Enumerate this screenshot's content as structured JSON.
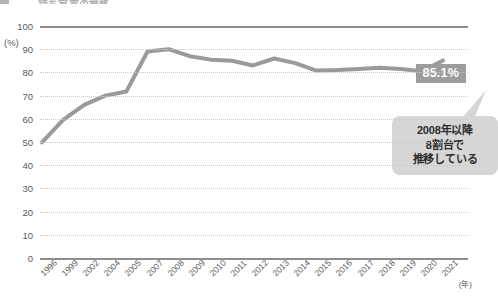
{
  "title": {
    "marker": "legend-square",
    "text": "持ち家率の推移"
  },
  "axes": {
    "y_unit": "(%)",
    "x_unit": "(年)",
    "y_ticks": [
      "100",
      "90",
      "80",
      "70",
      "60",
      "50",
      "40",
      "30",
      "20",
      "10",
      "0"
    ]
  },
  "annotations": {
    "value_badge": "85.1%",
    "callout": {
      "line1": "2008年以降",
      "line2": "8割台で",
      "line3": "推移している"
    }
  },
  "colors": {
    "series_line": "#9a9a9a",
    "axis": "#8e8e8e",
    "gridline": "#c9c9c9",
    "badge_bg": "#9d9d9d",
    "badge_text": "#ffffff",
    "callout_bg": "#d6d6d6",
    "callout_text": "#2d2d2d"
  },
  "chart_data": {
    "type": "line",
    "title": "持ち家率の推移",
    "xlabel": "(年)",
    "ylabel": "(%)",
    "ylim": [
      0,
      100
    ],
    "ytick_step": 10,
    "grid": true,
    "legend": false,
    "categories": [
      "1996",
      "1999",
      "2002",
      "2004",
      "2005",
      "2007",
      "2008",
      "2009",
      "2010",
      "2011",
      "2012",
      "2013",
      "2014",
      "2015",
      "2016",
      "2017",
      "2018",
      "2019",
      "2020",
      "2021"
    ],
    "values": [
      49.8,
      59.5,
      66.0,
      70.0,
      71.8,
      89.0,
      90.0,
      87.0,
      85.5,
      85.0,
      83.0,
      86.0,
      84.0,
      80.8,
      81.0,
      81.5,
      82.0,
      81.5,
      80.5,
      85.1
    ],
    "annotations": [
      {
        "text": "85.1%",
        "x": "2021",
        "y": 85.1
      },
      {
        "text": "2008年以降 8割台で推移している",
        "x": "2016",
        "y": 55
      }
    ]
  }
}
